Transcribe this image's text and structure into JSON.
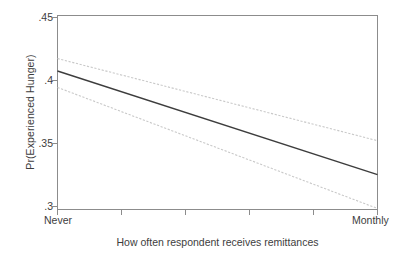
{
  "chart_data": {
    "type": "line",
    "title": "",
    "subtitle": "",
    "xlabel": "How often respondent receives remittances",
    "ylabel": "Pr(Experienced Hunger)",
    "xlim": [
      0,
      5
    ],
    "ylim": [
      0.3,
      0.45
    ],
    "grid": false,
    "legend": false,
    "legend_position": "none",
    "x_tick_labels": [
      "Never",
      "",
      "",
      "",
      "",
      "Monthly"
    ],
    "x_tick_values": [
      0,
      1,
      2,
      3,
      4,
      5
    ],
    "y_tick_labels": [
      ".3",
      ".35",
      ".4",
      ".45"
    ],
    "y_tick_values": [
      0.3,
      0.35,
      0.4,
      0.45
    ],
    "x": [
      0,
      5
    ],
    "series": [
      {
        "name": "Upper confidence bound",
        "style": "dotted-light",
        "color": "#c9c9c9",
        "values": [
          0.4167,
          0.3532
        ]
      },
      {
        "name": "Predicted probability",
        "style": "solid-dark",
        "color": "#3d3d3d",
        "values": [
          0.4071,
          0.327
        ]
      },
      {
        "name": "Lower confidence bound",
        "style": "dotted-light",
        "color": "#c9c9c9",
        "values": [
          0.3944,
          0.3008
        ]
      }
    ],
    "annotations": []
  },
  "axes": {
    "y_title": "Pr(Experienced Hunger)",
    "x_title": "How often respondent receives remittances",
    "y_ticks": [
      {
        "label": ".45",
        "value": 0.45
      },
      {
        "label": ".4",
        "value": 0.4
      },
      {
        "label": ".35",
        "value": 0.35
      },
      {
        "label": ".3",
        "value": 0.3
      }
    ],
    "x_ticks": [
      {
        "label": "Never",
        "value": 0
      },
      {
        "label": "",
        "value": 1
      },
      {
        "label": "",
        "value": 2
      },
      {
        "label": "",
        "value": 3
      },
      {
        "label": "",
        "value": 4
      },
      {
        "label": "Monthly",
        "value": 5
      }
    ]
  },
  "colors": {
    "background": "#ffffff",
    "axis": "#8c8c8c",
    "text": "#3d3d3d",
    "line_main": "#3d3d3d",
    "line_ci": "#c9c9c9"
  }
}
